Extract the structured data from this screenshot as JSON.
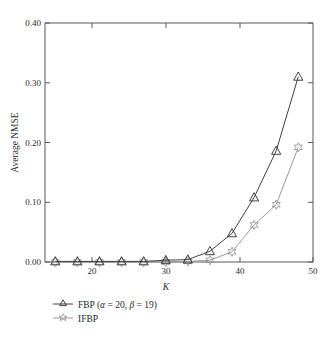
{
  "chart_data": {
    "type": "line",
    "title": "",
    "xlabel": "K",
    "ylabel": "Average NMSE",
    "xlim": [
      13.6,
      50
    ],
    "ylim": [
      0.0,
      0.4
    ],
    "xticks": [
      20,
      30,
      40,
      50
    ],
    "xtick_labels": [
      "20",
      "30",
      "40",
      "50"
    ],
    "yticks": [
      0.0,
      0.1,
      0.2,
      0.3,
      0.4
    ],
    "ytick_labels": [
      "0.00",
      "0.10",
      "0.20",
      "0.30",
      "0.40"
    ],
    "grid": false,
    "legend_position": "below-plot-left",
    "x": [
      15,
      18,
      21,
      24,
      27,
      30,
      33,
      36,
      39,
      42,
      45,
      48
    ],
    "series": [
      {
        "name": "FBP (α = 20, β = 19)",
        "marker": "triangle-up",
        "color": "#404040",
        "values": [
          0.001,
          0.001,
          0.001,
          0.001,
          0.001,
          0.003,
          0.004,
          0.018,
          0.048,
          0.108,
          0.186,
          0.31
        ]
      },
      {
        "name": "IFBP",
        "marker": "star-6",
        "color": "#9a9a9a",
        "values": [
          0.0,
          0.0,
          0.0,
          0.0,
          0.0,
          0.0,
          0.001,
          0.003,
          0.017,
          0.062,
          0.096,
          0.192
        ]
      }
    ]
  },
  "legend": {
    "items": [
      {
        "label_plain": "FBP (",
        "alpha_symbol": "α",
        "alpha_eq": " = 20, ",
        "beta_symbol": "β",
        "beta_eq": " = 19)",
        "marker": "triangle-up",
        "name": "fbp"
      },
      {
        "label_plain": "IFBP",
        "marker": "star-6",
        "name": "ifbp"
      }
    ]
  },
  "axis": {
    "y_title": "Average NMSE",
    "x_title": "K"
  }
}
